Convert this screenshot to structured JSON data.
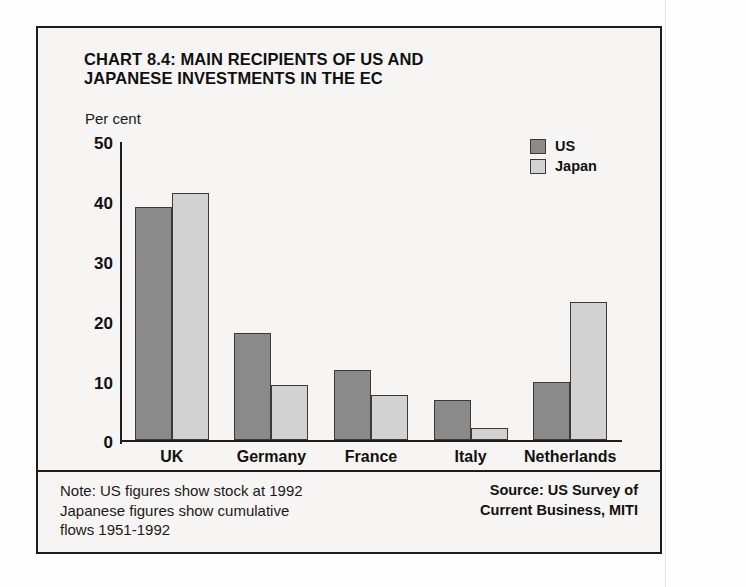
{
  "chart_data": {
    "type": "bar",
    "title": "CHART 8.4: MAIN RECIPIENTS OF US AND JAPANESE INVESTMENTS IN THE EC",
    "title_line_1": "CHART 8.4: MAIN RECIPIENTS OF US AND",
    "title_line_2": "JAPANESE INVESTMENTS IN THE EC",
    "xlabel": "",
    "ylabel": "Per cent",
    "ylim": [
      0,
      50
    ],
    "yticks": [
      0,
      10,
      20,
      30,
      40,
      50
    ],
    "ytick_labels": [
      "0",
      "10",
      "20",
      "30",
      "40",
      "50"
    ],
    "grid": false,
    "legend_position": "top-right",
    "categories": [
      "UK",
      "Germany",
      "France",
      "Italy",
      "Netherlands"
    ],
    "series": [
      {
        "name": "US",
        "color": "#8a8a8a",
        "values": [
          38.8,
          17.8,
          11.7,
          6.6,
          9.7
        ]
      },
      {
        "name": "Japan",
        "color": "#d2d2d2",
        "values": [
          41.2,
          9.2,
          7.5,
          2.0,
          23.0
        ]
      }
    ],
    "note": "Note: US figures show stock at 1992 Japanese figures show cumulative flows 1951-1992",
    "source": "Source: US Survey of Current Business, MITI"
  },
  "legend": {
    "items": [
      {
        "label": "US",
        "color": "#8a8a8a"
      },
      {
        "label": "Japan",
        "color": "#d2d2d2"
      }
    ]
  },
  "footer": {
    "note_lines": [
      "Note: US figures show stock at 1992",
      "Japanese figures show cumulative",
      "flows 1951-1992"
    ],
    "source_lines": [
      "Source: US Survey of",
      "Current Business, MITI"
    ]
  }
}
